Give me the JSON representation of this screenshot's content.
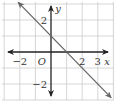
{
  "chart_data": {
    "type": "line",
    "title": "",
    "xlabel": "x",
    "ylabel": "y",
    "xlim": [
      -3,
      4
    ],
    "ylim": [
      -3,
      3
    ],
    "grid": true,
    "origin_label": "O",
    "x_tick_labels": [
      {
        "value": -2,
        "label": "−2"
      },
      {
        "value": 2,
        "label": "2"
      },
      {
        "value": 3,
        "label": "3"
      }
    ],
    "y_tick_labels": [
      {
        "value": 2,
        "label": "2"
      },
      {
        "value": -2,
        "label": "−2"
      }
    ],
    "series": [
      {
        "name": "y = -x + 1",
        "equation": "y = -x + 1",
        "slope": -1,
        "y_intercept": 1,
        "x_intercept": 1,
        "x": [
          -2,
          -1,
          0,
          1,
          2,
          3,
          4
        ],
        "y": [
          3,
          2,
          1,
          0,
          -1,
          -2,
          -3
        ],
        "arrows_both_ends": true,
        "color": "#666666"
      }
    ],
    "legend": "none"
  },
  "colors": {
    "grid": "#cccccc",
    "axis": "#222222",
    "line": "#666666",
    "text": "#333333"
  }
}
